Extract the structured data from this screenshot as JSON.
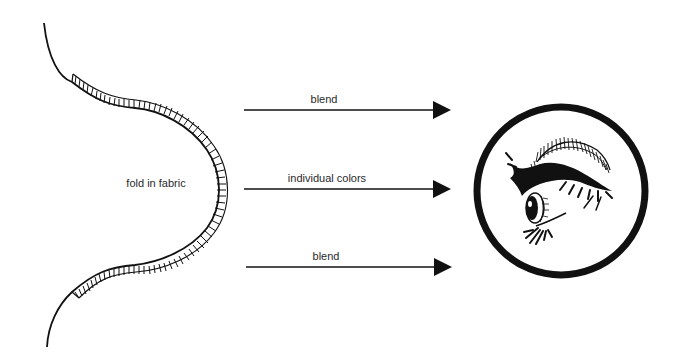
{
  "diagram": {
    "fold": {
      "label": "fold in fabric"
    },
    "arrows": [
      {
        "label": "blend"
      },
      {
        "label": "individual colors"
      },
      {
        "label": "blend"
      }
    ],
    "viewer": {
      "icon": "eye-in-circle-icon"
    },
    "colors": {
      "ink": "#111111",
      "text": "#2a2a2a",
      "background": "#ffffff"
    }
  }
}
